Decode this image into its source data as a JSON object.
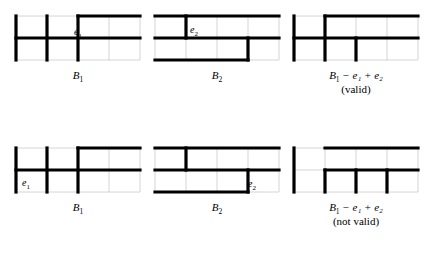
{
  "figure": {
    "background_color": "#ffffff",
    "thick_line_color": "#000000",
    "thin_line_color": "#c9c9c9",
    "cell_width": 31,
    "cell_height": 22,
    "columns": 4,
    "rows": 2
  },
  "panels": [
    {
      "id": "top-left",
      "name": "B1-top",
      "x": 16,
      "y": 16,
      "caption_main": "B",
      "caption_sub": "1",
      "caption_rest": "",
      "validity": "",
      "edge_label": {
        "main": "e",
        "sub": "1",
        "x": 74,
        "y": 26
      },
      "h_segments": [
        {
          "row": 0,
          "col_start": 2,
          "col_end": 4
        },
        {
          "row": 1,
          "col_start": 0,
          "col_end": 4
        }
      ],
      "v_segments": [
        {
          "col": 0,
          "row_start": 0,
          "row_end": 2
        },
        {
          "col": 1,
          "row_start": 0,
          "row_end": 2
        },
        {
          "col": 2,
          "row_start": 0,
          "row_end": 2
        }
      ]
    },
    {
      "id": "top-middle",
      "name": "B2-top",
      "x": 155,
      "y": 16,
      "caption_main": "B",
      "caption_sub": "2",
      "caption_rest": "",
      "validity": "",
      "edge_label": {
        "main": "e",
        "sub": "2",
        "x": 190,
        "y": 24
      },
      "h_segments": [
        {
          "row": 0,
          "col_start": 0,
          "col_end": 4
        },
        {
          "row": 1,
          "col_start": 0,
          "col_end": 4
        },
        {
          "row": 2,
          "col_start": 0,
          "col_end": 3
        }
      ],
      "v_segments": [
        {
          "col": 1,
          "row_start": 0,
          "row_end": 1
        },
        {
          "col": 3,
          "row_start": 1,
          "row_end": 2
        }
      ]
    },
    {
      "id": "top-right",
      "name": "B1-e1+e2-top",
      "x": 294,
      "y": 16,
      "caption_main": "B",
      "caption_sub": "1",
      "caption_rest": "− e₁ + e₂",
      "validity": "(valid)",
      "edge_label": null,
      "h_segments": [
        {
          "row": 0,
          "col_start": 1,
          "col_end": 4
        },
        {
          "row": 1,
          "col_start": 0,
          "col_end": 4
        }
      ],
      "v_segments": [
        {
          "col": 0,
          "row_start": 0,
          "row_end": 2
        },
        {
          "col": 1,
          "row_start": 0,
          "row_end": 2
        },
        {
          "col": 2,
          "row_start": 1,
          "row_end": 2
        }
      ]
    },
    {
      "id": "bottom-left",
      "name": "B1-bottom",
      "x": 16,
      "y": 148,
      "caption_main": "B",
      "caption_sub": "1",
      "caption_rest": "",
      "validity": "",
      "edge_label": {
        "main": "e",
        "sub": "1",
        "x": 22,
        "y": 177
      },
      "h_segments": [
        {
          "row": 0,
          "col_start": 2,
          "col_end": 4
        },
        {
          "row": 1,
          "col_start": 0,
          "col_end": 4
        }
      ],
      "v_segments": [
        {
          "col": 0,
          "row_start": 0,
          "row_end": 2
        },
        {
          "col": 1,
          "row_start": 0,
          "row_end": 2
        },
        {
          "col": 2,
          "row_start": 0,
          "row_end": 2
        }
      ]
    },
    {
      "id": "bottom-middle",
      "name": "B2-bottom",
      "x": 155,
      "y": 148,
      "caption_main": "B",
      "caption_sub": "2",
      "caption_rest": "",
      "validity": "",
      "edge_label": {
        "main": "e",
        "sub": "2",
        "x": 248,
        "y": 178
      },
      "h_segments": [
        {
          "row": 0,
          "col_start": 0,
          "col_end": 4
        },
        {
          "row": 1,
          "col_start": 0,
          "col_end": 4
        },
        {
          "row": 2,
          "col_start": 0,
          "col_end": 3
        }
      ],
      "v_segments": [
        {
          "col": 1,
          "row_start": 0,
          "row_end": 1
        },
        {
          "col": 3,
          "row_start": 1,
          "row_end": 2
        }
      ]
    },
    {
      "id": "bottom-right",
      "name": "B1-e1+e2-bottom",
      "x": 294,
      "y": 148,
      "caption_main": "B",
      "caption_sub": "1",
      "caption_rest": "− e₁ + e₂",
      "validity": "(not valid)",
      "edge_label": null,
      "h_segments": [
        {
          "row": 0,
          "col_start": 1,
          "col_end": 4
        },
        {
          "row": 1,
          "col_start": 1,
          "col_end": 4
        }
      ],
      "v_segments": [
        {
          "col": 0,
          "row_start": 0,
          "row_end": 2
        },
        {
          "col": 1,
          "row_start": 1,
          "row_end": 2
        },
        {
          "col": 2,
          "row_start": 1,
          "row_end": 2
        },
        {
          "col": 3,
          "row_start": 1,
          "row_end": 2
        }
      ]
    }
  ],
  "captions": {
    "top_left": "B₁",
    "top_middle": "B₂",
    "top_right": "B₁ − e₁ + e₂",
    "top_right_validity": "(valid)",
    "bottom_left": "B₁",
    "bottom_middle": "B₂",
    "bottom_right": "B₁ − e₁ + e₂",
    "bottom_right_validity": "(not valid)"
  }
}
